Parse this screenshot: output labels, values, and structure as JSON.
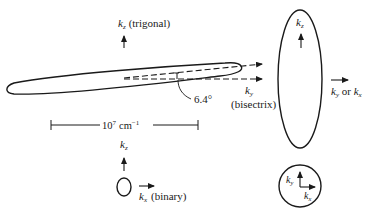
{
  "figure": {
    "type": "fermi-surface-ellipsoids",
    "colors": {
      "stroke": "#1a1a1a",
      "background": "#ffffff"
    }
  },
  "electron_pocket_side": {
    "axis_kz": {
      "symbol": "k",
      "subscript": "z",
      "note": "(trigonal)"
    },
    "axis_ky": {
      "symbol": "k",
      "subscript": "y",
      "note": "(bisectrix)"
    },
    "tilt_angle": "6.4°",
    "scale_bar": {
      "base": "10",
      "exp_base": "7",
      "unit": "cm",
      "unit_exp": "−1"
    }
  },
  "electron_pocket_end": {
    "axis_kz": {
      "symbol": "k",
      "subscript": "z"
    },
    "axis_horizontal": {
      "label_a": "k",
      "sub_a": "y",
      "joiner": " or ",
      "label_b": "k",
      "sub_b": "x"
    }
  },
  "small_pocket": {
    "axis_kz": {
      "symbol": "k",
      "subscript": "z"
    },
    "axis_kx": {
      "symbol": "k",
      "subscript": "x",
      "note": "(binary)"
    }
  },
  "circle_section": {
    "axis_ky": {
      "symbol": "k",
      "subscript": "y"
    },
    "axis_kx": {
      "symbol": "k",
      "subscript": "x"
    }
  }
}
